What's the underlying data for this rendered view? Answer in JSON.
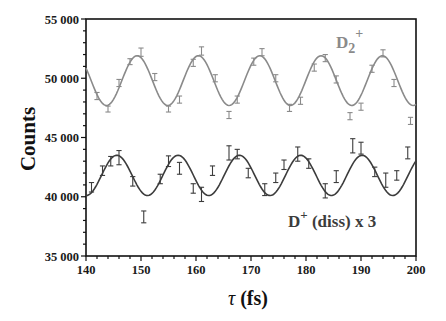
{
  "chart_data": {
    "type": "line",
    "title": "",
    "xlabel": "τ (fs)",
    "ylabel": "Counts",
    "xlim": [
      140,
      200
    ],
    "ylim": [
      35000,
      55000
    ],
    "x_ticks": [
      140,
      150,
      160,
      170,
      180,
      190,
      200
    ],
    "x_tick_labels": [
      "140",
      "150",
      "160",
      "170",
      "180",
      "190",
      "200"
    ],
    "y_ticks": [
      35000,
      40000,
      45000,
      50000,
      55000
    ],
    "y_tick_labels": [
      "35 000",
      "40 000",
      "45 000",
      "50 000",
      "55 000"
    ],
    "grid": false,
    "legend": "inline labels",
    "series": [
      {
        "name": "D2+",
        "label_main": "D",
        "label_sub": "2",
        "label_sup": "+",
        "color": "#8a8a8a",
        "fit": {
          "mean": 49800,
          "amplitude": 2100,
          "period": 11.15,
          "phase_peak": 149.3
        },
        "points": [
          {
            "x": 142.0,
            "y": 48500,
            "err": 300
          },
          {
            "x": 144.0,
            "y": 47400,
            "err": 250
          },
          {
            "x": 146.0,
            "y": 49600,
            "err": 300
          },
          {
            "x": 148.0,
            "y": 51400,
            "err": 250
          },
          {
            "x": 150.0,
            "y": 52200,
            "err": 350
          },
          {
            "x": 152.5,
            "y": 50100,
            "err": 300
          },
          {
            "x": 155.0,
            "y": 47400,
            "err": 250
          },
          {
            "x": 157.0,
            "y": 48200,
            "err": 300
          },
          {
            "x": 159.5,
            "y": 51300,
            "err": 300
          },
          {
            "x": 161.0,
            "y": 52300,
            "err": 350
          },
          {
            "x": 163.5,
            "y": 50000,
            "err": 300
          },
          {
            "x": 166.0,
            "y": 46900,
            "err": 300
          },
          {
            "x": 167.5,
            "y": 48200,
            "err": 300
          },
          {
            "x": 170.5,
            "y": 51400,
            "err": 300
          },
          {
            "x": 172.0,
            "y": 52200,
            "err": 300
          },
          {
            "x": 174.5,
            "y": 50000,
            "err": 300
          },
          {
            "x": 177.0,
            "y": 47500,
            "err": 300
          },
          {
            "x": 179.0,
            "y": 48100,
            "err": 300
          },
          {
            "x": 181.5,
            "y": 50900,
            "err": 300
          },
          {
            "x": 183.5,
            "y": 51700,
            "err": 300
          },
          {
            "x": 185.5,
            "y": 49900,
            "err": 300
          },
          {
            "x": 188.0,
            "y": 46800,
            "err": 300
          },
          {
            "x": 190.0,
            "y": 47600,
            "err": 300
          },
          {
            "x": 192.0,
            "y": 50800,
            "err": 300
          },
          {
            "x": 194.0,
            "y": 52100,
            "err": 300
          },
          {
            "x": 196.0,
            "y": 49600,
            "err": 300
          },
          {
            "x": 199.0,
            "y": 46400,
            "err": 300
          }
        ]
      },
      {
        "name": "D+ (diss) x 3",
        "label_main": "D",
        "label_sup": "+",
        "label_rest": " (diss) x 3",
        "color": "#3c3c3c",
        "fit": {
          "mean": 41800,
          "amplitude": 1700,
          "period": 11.15,
          "phase_peak": 145.6
        },
        "points": [
          {
            "x": 141.0,
            "y": 40800,
            "err": 400
          },
          {
            "x": 143.0,
            "y": 42200,
            "err": 400
          },
          {
            "x": 144.5,
            "y": 43000,
            "err": 400
          },
          {
            "x": 146.0,
            "y": 43300,
            "err": 600
          },
          {
            "x": 148.5,
            "y": 41300,
            "err": 400
          },
          {
            "x": 150.5,
            "y": 38300,
            "err": 500
          },
          {
            "x": 153.5,
            "y": 41500,
            "err": 400
          },
          {
            "x": 155.0,
            "y": 43000,
            "err": 450
          },
          {
            "x": 157.0,
            "y": 42400,
            "err": 500
          },
          {
            "x": 159.5,
            "y": 40700,
            "err": 400
          },
          {
            "x": 161.0,
            "y": 40200,
            "err": 600
          },
          {
            "x": 163.0,
            "y": 42200,
            "err": 400
          },
          {
            "x": 166.0,
            "y": 43700,
            "err": 600
          },
          {
            "x": 167.5,
            "y": 43600,
            "err": 400
          },
          {
            "x": 169.5,
            "y": 42000,
            "err": 400
          },
          {
            "x": 172.5,
            "y": 40600,
            "err": 500
          },
          {
            "x": 174.5,
            "y": 41600,
            "err": 400
          },
          {
            "x": 176.0,
            "y": 42700,
            "err": 400
          },
          {
            "x": 178.5,
            "y": 43600,
            "err": 600
          },
          {
            "x": 180.5,
            "y": 42800,
            "err": 400
          },
          {
            "x": 183.5,
            "y": 40500,
            "err": 600
          },
          {
            "x": 185.5,
            "y": 41700,
            "err": 500
          },
          {
            "x": 188.5,
            "y": 44300,
            "err": 600
          },
          {
            "x": 190.0,
            "y": 44100,
            "err": 500
          },
          {
            "x": 192.5,
            "y": 42100,
            "err": 400
          },
          {
            "x": 194.5,
            "y": 41400,
            "err": 600
          },
          {
            "x": 196.5,
            "y": 41800,
            "err": 400
          },
          {
            "x": 198.5,
            "y": 43700,
            "err": 500
          }
        ]
      }
    ]
  },
  "labels": {
    "ylabel": "Counts",
    "xlabel_symbol": "τ",
    "xlabel_unit": "(fs)",
    "d2_main": "D",
    "d2_sub": "2",
    "d2_sup": "+",
    "dplus_main": "D",
    "dplus_sup": "+",
    "dplus_rest": " (diss) x 3"
  }
}
